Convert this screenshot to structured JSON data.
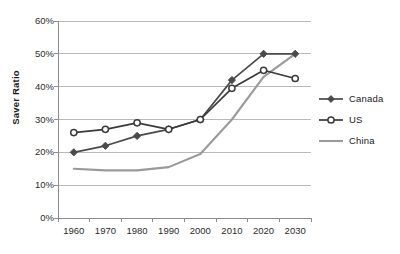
{
  "chart_data": {
    "type": "line",
    "title": "",
    "xlabel": "",
    "ylabel": "Saver Ratio",
    "categories": [
      "1960",
      "1970",
      "1980",
      "1990",
      "2000",
      "2010",
      "2020",
      "2030"
    ],
    "x": [
      1960,
      1970,
      1980,
      1990,
      2000,
      2010,
      2020,
      2030
    ],
    "xlim": [
      1955,
      2035
    ],
    "ylim": [
      0,
      60
    ],
    "yticks": [
      0,
      10,
      20,
      30,
      40,
      50,
      60
    ],
    "ytick_labels": [
      "0%",
      "10%",
      "20%",
      "30%",
      "40%",
      "50%",
      "60%"
    ],
    "grid": "horizontal",
    "legend_position": "right",
    "series": [
      {
        "name": "Canada",
        "color": "#4a4a4a",
        "marker": "diamond",
        "values": [
          20,
          22,
          25,
          27,
          30,
          42,
          50,
          50
        ]
      },
      {
        "name": "US",
        "color": "#3a3a3a",
        "marker": "circle-open",
        "values": [
          26,
          27,
          29,
          27,
          30,
          39.5,
          45,
          42.5
        ]
      },
      {
        "name": "China",
        "color": "#9a9a9a",
        "marker": "none",
        "values": [
          15,
          14.5,
          14.5,
          15.5,
          19.5,
          30,
          43,
          50
        ]
      }
    ]
  },
  "legend": {
    "items": [
      {
        "label": "Canada",
        "marker": "diamond",
        "color": "#4a4a4a"
      },
      {
        "label": "US",
        "marker": "circle-open",
        "color": "#3a3a3a"
      },
      {
        "label": "China",
        "marker": "none",
        "color": "#9a9a9a"
      }
    ]
  }
}
